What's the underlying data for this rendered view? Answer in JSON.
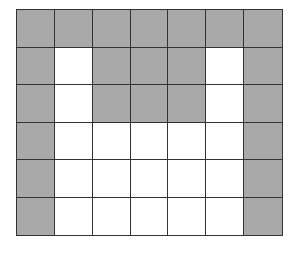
{
  "diagram": {
    "type": "shaded-grid",
    "rows": 6,
    "cols": 7,
    "colors": {
      "shaded": "#a9a9a9",
      "empty": "#ffffff",
      "line": "#333333"
    },
    "cells": [
      [
        1,
        1,
        1,
        1,
        1,
        1,
        1
      ],
      [
        1,
        0,
        1,
        1,
        1,
        0,
        1
      ],
      [
        1,
        0,
        1,
        1,
        1,
        0,
        1
      ],
      [
        1,
        0,
        0,
        0,
        0,
        0,
        1
      ],
      [
        1,
        0,
        0,
        0,
        0,
        0,
        1
      ],
      [
        1,
        0,
        0,
        0,
        0,
        0,
        1
      ]
    ]
  }
}
